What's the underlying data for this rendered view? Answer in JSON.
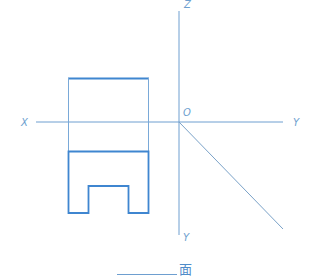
{
  "diagram": {
    "type": "orthographic-projection",
    "colors": {
      "axis": "#5b93cc",
      "thin": "#7aa9d8",
      "bold": "#3f86d0"
    },
    "axes": {
      "labels": {
        "z": "Z",
        "x": "X",
        "y_right": "Y",
        "y_down": "Y",
        "origin": "O"
      }
    },
    "top_view_projection": {
      "description": "rectangle above X axis (projection lines)"
    },
    "front_view_shape": {
      "description": "rectangle with bottom rectangular notch"
    },
    "caption": {
      "blank": "",
      "suffix": "面"
    }
  }
}
